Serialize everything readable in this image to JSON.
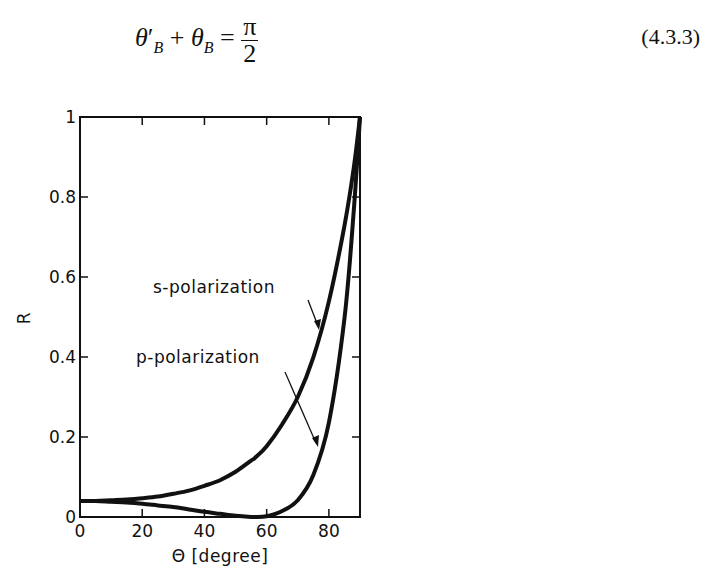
{
  "equation": {
    "lhs": "θ′B + θB =",
    "frac_num": "π",
    "frac_den": "2",
    "number": "(4.3.3)"
  },
  "chart_data": {
    "type": "line",
    "title": "",
    "xlabel": "Θ [degree]",
    "ylabel": "R",
    "xlim": [
      0,
      90
    ],
    "ylim": [
      0,
      1
    ],
    "xticks": [
      0,
      20,
      40,
      60,
      80
    ],
    "yticks": [
      0,
      0.2,
      0.4,
      0.6,
      0.8,
      1
    ],
    "ytick_labels": [
      "0",
      "0.2",
      "0.4",
      "0.6",
      "0.8",
      "1"
    ],
    "grid": false,
    "x": [
      0,
      5,
      10,
      15,
      20,
      25,
      30,
      35,
      40,
      45,
      50,
      55,
      56.3,
      60,
      65,
      70,
      75,
      80,
      85,
      88,
      90
    ],
    "series": [
      {
        "name": "s-polarization",
        "values": [
          0.04,
          0.04,
          0.042,
          0.044,
          0.047,
          0.051,
          0.058,
          0.066,
          0.078,
          0.092,
          0.113,
          0.141,
          0.148,
          0.177,
          0.232,
          0.3,
          0.399,
          0.539,
          0.728,
          0.873,
          1.0
        ]
      },
      {
        "name": "p-polarization",
        "values": [
          0.04,
          0.04,
          0.038,
          0.036,
          0.033,
          0.029,
          0.025,
          0.019,
          0.013,
          0.008,
          0.003,
          0.0,
          0.0,
          0.002,
          0.015,
          0.042,
          0.105,
          0.236,
          0.496,
          0.766,
          1.0
        ]
      }
    ],
    "annotations": [
      {
        "text": "s-polarization",
        "arrow_to_x": 77
      },
      {
        "text": "p-polarization",
        "arrow_to_x": 78
      }
    ]
  }
}
